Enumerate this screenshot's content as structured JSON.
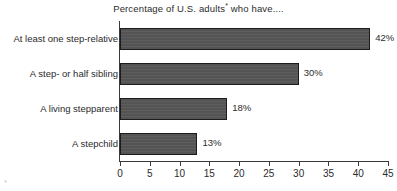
{
  "chart_data": {
    "type": "bar",
    "orientation": "horizontal",
    "title": "Percentage of U.S. adults",
    "title_superscript": "*",
    "title_suffix": " who have....",
    "title_full": "Percentage of U.S. adults* who have....",
    "categories": [
      "At least one step-relative",
      "A step- or half sibling",
      "A living stepparent",
      "A stepchild"
    ],
    "values": [
      42,
      30,
      18,
      13
    ],
    "value_labels": [
      "42%",
      "30%",
      "18%",
      "13%"
    ],
    "xlabel": "",
    "ylabel": "",
    "xlim": [
      0,
      45
    ],
    "xticks": [
      0,
      5,
      10,
      15,
      20,
      25,
      30,
      35,
      40,
      45
    ],
    "xtick_labels": [
      "0",
      "5",
      "10",
      "15",
      "20",
      "25",
      "30",
      "35",
      "40",
      "45"
    ],
    "grid": false,
    "legend": false,
    "bar_color": "#575757",
    "bar_edge_color": "#1c1c1c",
    "axis_color": "#3a3a3a",
    "text_color": "#2b2b2b",
    "background": "#ffffff"
  },
  "footnote": {
    "marker": "*"
  }
}
